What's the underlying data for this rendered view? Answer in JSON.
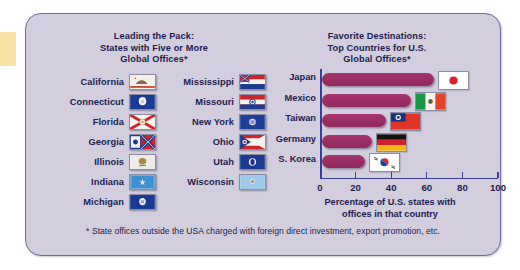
{
  "panel": {
    "bg_color": "#d2cede",
    "border_color": "#6b6f9b",
    "accent_tab_color": "#f7e3a6"
  },
  "left_section": {
    "heading_line1": "Leading the Pack:",
    "heading_line2": "States with Five or More",
    "heading_line3": "Global Offices*",
    "column1": [
      {
        "state": "California",
        "flag": "flag-california"
      },
      {
        "state": "Connecticut",
        "flag": "flag-connecticut"
      },
      {
        "state": "Florida",
        "flag": "flag-florida"
      },
      {
        "state": "Georgia",
        "flag": "flag-georgia"
      },
      {
        "state": "Illinois",
        "flag": "flag-illinois"
      },
      {
        "state": "Indiana",
        "flag": "flag-indiana"
      },
      {
        "state": "Michigan",
        "flag": "flag-michigan"
      }
    ],
    "column2": [
      {
        "state": "Mississippi",
        "flag": "flag-mississippi"
      },
      {
        "state": "Missouri",
        "flag": "flag-missouri"
      },
      {
        "state": "New York",
        "flag": "flag-new-york"
      },
      {
        "state": "Ohio",
        "flag": "flag-ohio"
      },
      {
        "state": "Utah",
        "flag": "flag-utah"
      },
      {
        "state": "Wisconsin",
        "flag": "flag-wisconsin"
      }
    ]
  },
  "right_section": {
    "heading_line1": "Favorite Destinations:",
    "heading_line2": "Top Countries for U.S.",
    "heading_line3": "Global Offices*"
  },
  "chart_data": {
    "type": "bar",
    "orientation": "horizontal",
    "title": "Favorite Destinations: Top Countries for U.S. Global Offices*",
    "categories": [
      "Japan",
      "Mexico",
      "Taiwan",
      "Germany",
      "S. Korea"
    ],
    "values": [
      64,
      51,
      37,
      29,
      25
    ],
    "flags": [
      "flag-japan",
      "flag-mexico",
      "flag-taiwan",
      "flag-germany",
      "flag-south-korea"
    ],
    "xlabel_line1": "Percentage of U.S. states with",
    "xlabel_line2": "offices in that country",
    "ylabel": "",
    "xlim": [
      0,
      100
    ],
    "xticks": [
      0,
      20,
      40,
      60,
      80,
      100
    ],
    "xtick_labels": [
      "0",
      "20",
      "40",
      "60",
      "80",
      "100"
    ],
    "grid": false,
    "legend": "none",
    "bar_color": "#9e2f67",
    "axis_color": "#3b3f8f"
  },
  "footnote": "* State offices outside the USA charged with foreign direct investment, export promotion, etc."
}
